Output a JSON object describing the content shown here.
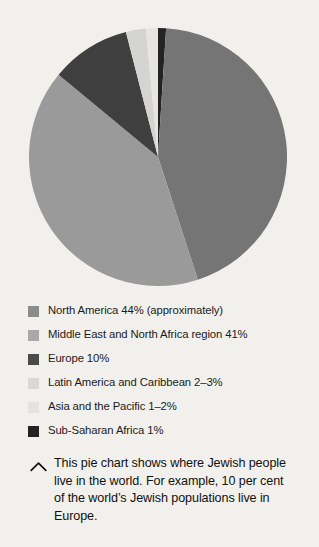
{
  "figure": {
    "background_color": "#f2f0ec",
    "caption": {
      "icon": "chevron-up-icon",
      "icon_color": "#111111",
      "text": "This pie chart shows where Jewish people live in the world. For example, 10 per cent of the world’s Jewish populations live in Europe."
    }
  },
  "chart_data": {
    "type": "pie",
    "title": "",
    "xlabel": "",
    "ylabel": "",
    "grid": false,
    "legend_position": "below",
    "start_angle_deg": 0,
    "direction": "clockwise",
    "center_px": [
      129,
      130
    ],
    "radius_px": 129,
    "labels": [
      "Sub-Saharan Africa",
      "North America",
      "Middle East and North Africa region",
      "Europe",
      "Latin America and Caribbean",
      "Asia and the Pacific"
    ],
    "values": [
      1,
      44,
      41,
      10,
      2.5,
      1.5
    ],
    "colors": [
      "#232323",
      "#757575",
      "#9a9a9a",
      "#3f3f3f",
      "#d4d4d2",
      "#e6e5e2"
    ],
    "value_labels": [
      "1%",
      "44% (approximately)",
      "41%",
      "10%",
      "2–3%",
      "1–2%"
    ]
  },
  "legend": {
    "items": [
      {
        "label": "North America 44% (approximately)",
        "color": "#8c8c8c",
        "region": "North America",
        "value_text": "44% (approximately)"
      },
      {
        "label": "Middle East and North Africa region 41%",
        "color": "#a8a8a8",
        "region": "Middle East and North Africa region",
        "value_text": "41%"
      },
      {
        "label": "Europe 10%",
        "color": "#4a4a4a",
        "region": "Europe",
        "value_text": "10%"
      },
      {
        "label": "Latin America and Caribbean 2–3%",
        "color": "#d8d8d6",
        "region": "Latin America and Caribbean",
        "value_text": "2–3%"
      },
      {
        "label": "Asia and the Pacific 1–2%",
        "color": "#e4e3e0",
        "region": "Asia and the Pacific",
        "value_text": "1–2%"
      },
      {
        "label": "Sub-Saharan Africa 1%",
        "color": "#222222",
        "region": "Sub-Saharan Africa",
        "value_text": "1%"
      }
    ]
  }
}
